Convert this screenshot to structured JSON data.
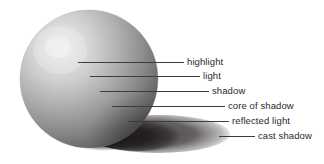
{
  "figure": {
    "width": 324,
    "height": 164,
    "background_color": "#ffffff"
  },
  "sphere": {
    "center_x": 89,
    "center_y": 79,
    "radius": 69,
    "light_direction": "upper left",
    "highlight_x": 62,
    "highlight_y": 52,
    "colors": {
      "highlight": "#e3e3e3",
      "light": "#c6c6c6",
      "midtone": "#9d9d9d",
      "shadow": "#6f6f6f",
      "core_of_shadow": "#3f3f3f",
      "reflected_light": "#888888",
      "cast_shadow": "#231f1f",
      "cast_shadow_outer": "#4a4748"
    }
  },
  "labels": [
    {
      "id": "highlight",
      "text": "highlight",
      "text_x": 187,
      "text_y": 57,
      "leader_x": 78,
      "leader_y": 62,
      "leader_width": 106,
      "anchor_on": "sphere-highlight"
    },
    {
      "id": "light",
      "text": "light",
      "text_x": 203,
      "text_y": 71,
      "leader_x": 90,
      "leader_y": 76,
      "leader_width": 110,
      "anchor_on": "sphere-light-area"
    },
    {
      "id": "shadow",
      "text": "shadow",
      "text_x": 212,
      "text_y": 86,
      "leader_x": 100,
      "leader_y": 91,
      "leader_width": 109,
      "anchor_on": "sphere-shadow-area"
    },
    {
      "id": "core-of-shadow",
      "text": "core of shadow",
      "text_x": 228,
      "text_y": 101,
      "leader_x": 112,
      "leader_y": 106,
      "leader_width": 113,
      "anchor_on": "sphere-core-of-shadow"
    },
    {
      "id": "reflected-light",
      "text": "reflected light",
      "text_x": 232,
      "text_y": 116,
      "leader_x": 128,
      "leader_y": 121,
      "leader_width": 101,
      "anchor_on": "sphere-reflected-light"
    },
    {
      "id": "cast-shadow",
      "text": "cast shadow",
      "text_x": 258,
      "text_y": 131,
      "leader_x": 219,
      "leader_y": 136,
      "leader_width": 36,
      "anchor_on": "ground-cast-shadow"
    }
  ],
  "cast_shadow": {
    "left_x": 96,
    "right_x": 228,
    "top_y": 118,
    "bottom_y": 152,
    "direction": "to the lower right"
  },
  "text_color": "#2a2a2a",
  "leader_color": "#3c3c3c"
}
